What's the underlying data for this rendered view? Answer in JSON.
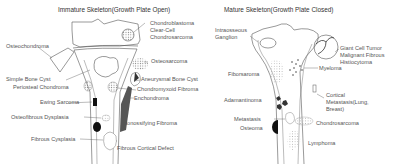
{
  "panels": {
    "immature": {
      "title": "Immature Skeleton(Growth Plate Open)",
      "labels": {
        "chondroblastoma": "Chondroblastoma",
        "clear_cell_1": "Clear-Cell",
        "clear_cell_2": "Chondrosarcoma",
        "osteochondroma": "Osteochondroma",
        "osteosarcoma": "Osteosarcoma",
        "simple_bone_cyst": "Simple Bone Cyst",
        "aneurysmal_bone_cyst": "Aneurysmal Bone Cyst",
        "periosteal_chondroma": "Periosteal Chondroma",
        "chondromyxoid_fibroma": "Chondromyxoid Fibroma",
        "enchondroma": "Enchondroma",
        "ewing_sarcoma": "Ewing Sarcoma",
        "osteofibrous_dysplasia": "Osteofibrous Dysplasia",
        "nonossifying_fibroma": "Nonossifying Fibroma",
        "fibrous_dysplasia": "Fibrous Cysplasia",
        "fibrous_cortical_defect": "Fibrous Cortical Defect"
      }
    },
    "mature": {
      "title": "Mature Skeleton(Growth Plate Closed)",
      "labels": {
        "intraosseous_1": "Intraosseous",
        "intraosseous_2": "Ganglion",
        "giant_cell_tumor": "Giant Cell Tumor",
        "mfh_1": "Malignant Fibrous",
        "mfh_2": "Histiocytoma",
        "fibrosarcoma": "Fiborsaroma",
        "myeloma": "Myeloma",
        "adamantinoma": "Adamantinoma",
        "cortical_metastasis_1": "Cortical",
        "cortical_metastasis_2": "Metastasis(Lung,",
        "cortical_metastasis_3": "Breast)",
        "metastasis": "Metastasis",
        "chondrosarcoma": "Chondrosarcoma",
        "osteoma": "Osteoma",
        "lymphoma": "Lymphoma"
      }
    }
  }
}
